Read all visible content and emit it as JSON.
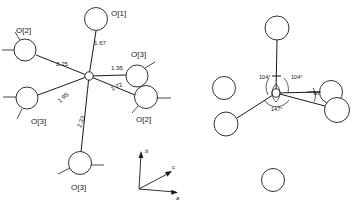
{
  "figure": {
    "type": "crystal-structure-coordination-diagram",
    "panel_count": 2
  },
  "left_panel": {
    "name": "bond-distance-diagram",
    "center_atom": {
      "label": "",
      "x": 89,
      "y": 76
    },
    "atoms": [
      {
        "id": "o1-top",
        "label": "O[1]",
        "cx": 96,
        "cy": 19,
        "r": 11.5,
        "label_x": 111,
        "label_y": 16
      },
      {
        "id": "o2-upperleft",
        "label": "O[2]",
        "cx": 25,
        "cy": 50,
        "r": 11.0,
        "label_x": 16,
        "label_y": 33
      },
      {
        "id": "o3-lowerleft",
        "label": "O[3]",
        "cx": 27,
        "cy": 98,
        "r": 11.0,
        "label_x": 31,
        "label_y": 124
      },
      {
        "id": "o3-bottom",
        "label": "O[3]",
        "cx": 80,
        "cy": 163,
        "r": 11.5,
        "label_x": 71,
        "label_y": 190
      },
      {
        "id": "o3-right",
        "label": "O[3]",
        "cx": 137,
        "cy": 76,
        "r": 11.0,
        "label_x": 131,
        "label_y": 57
      },
      {
        "id": "o2-rightlow",
        "label": "O[2]",
        "cx": 146,
        "cy": 97,
        "r": 11.5,
        "label_x": 136,
        "label_y": 122
      }
    ],
    "bond_distances": [
      {
        "id": "d-o1",
        "value": "1.67",
        "x": 94,
        "y": 45,
        "rotate": 0
      },
      {
        "id": "d-o2a",
        "value": "2.25",
        "x": 56,
        "y": 66,
        "rotate": 0
      },
      {
        "id": "d-o3b",
        "value": "1.95",
        "x": 60,
        "y": 103,
        "rotate": -42
      },
      {
        "id": "d-o3c",
        "value": "2.33",
        "x": 81,
        "y": 128,
        "rotate": -70
      },
      {
        "id": "d-o3d",
        "value": "1.95",
        "x": 111,
        "y": 70,
        "rotate": 0
      },
      {
        "id": "d-o2e",
        "value": "1.72",
        "x": 112,
        "y": 91,
        "rotate": -24
      }
    ]
  },
  "right_panel": {
    "name": "bond-angle-diagram",
    "center_atom": {
      "label": "",
      "x": 276,
      "y": 93
    },
    "atoms": [
      {
        "id": "r-top",
        "cx": 277,
        "cy": 28,
        "r": 12.0
      },
      {
        "id": "r-upperleft",
        "cx": 224,
        "cy": 88,
        "r": 11.5
      },
      {
        "id": "r-lowerleft",
        "cx": 226,
        "cy": 124,
        "r": 12.0
      },
      {
        "id": "r-rightupper",
        "cx": 331,
        "cy": 92,
        "r": 11.5
      },
      {
        "id": "r-rightlower",
        "cx": 337,
        "cy": 110,
        "r": 12.5
      },
      {
        "id": "r-bottom",
        "cx": 273,
        "cy": 180,
        "r": 11.5
      }
    ],
    "angles": [
      {
        "id": "a-left",
        "value": "104°",
        "x": 259,
        "y": 79
      },
      {
        "id": "a-right",
        "value": "104°",
        "x": 291,
        "y": 79
      },
      {
        "id": "a-bottom",
        "value": "147°",
        "x": 271,
        "y": 111
      },
      {
        "id": "a-far",
        "value": "98°",
        "x": 313,
        "y": 95
      }
    ]
  },
  "axis_indicator": {
    "name": "crystal-axis-triad",
    "origin_x": 139,
    "origin_y": 189,
    "axes": [
      {
        "id": "axis-b",
        "label": "b",
        "tip_x": 141,
        "tip_y": 152,
        "label_x": 145,
        "label_y": 153
      },
      {
        "id": "axis-c",
        "label": "c",
        "tip_x": 172,
        "tip_y": 172,
        "label_x": 172,
        "label_y": 169
      },
      {
        "id": "axis-a",
        "label": "a",
        "tip_x": 178,
        "tip_y": 192,
        "label_x": 176,
        "label_y": 200
      }
    ]
  }
}
